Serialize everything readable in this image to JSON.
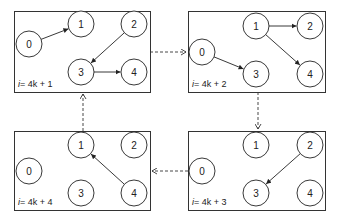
{
  "panels": [
    {
      "id": "p1",
      "caption_var": "i",
      "caption_expr": "= 4k + 1",
      "box": [
        14,
        11,
        136,
        81
      ],
      "nodes": [
        {
          "label": "0",
          "x": 29,
          "y": 44
        },
        {
          "label": "1",
          "x": 81,
          "y": 24
        },
        {
          "label": "2",
          "x": 134,
          "y": 24
        },
        {
          "label": "3",
          "x": 81,
          "y": 72
        },
        {
          "label": "4",
          "x": 134,
          "y": 72
        }
      ],
      "edges": [
        {
          "from": "0",
          "to": "1"
        },
        {
          "from": "2",
          "to": "3"
        },
        {
          "from": "3",
          "to": "4"
        }
      ]
    },
    {
      "id": "p2",
      "caption_var": "i",
      "caption_expr": "= 4k + 2",
      "box": [
        188,
        11,
        137,
        81
      ],
      "nodes": [
        {
          "label": "0",
          "x": 202,
          "y": 52
        },
        {
          "label": "1",
          "x": 256,
          "y": 26
        },
        {
          "label": "2",
          "x": 310,
          "y": 26
        },
        {
          "label": "3",
          "x": 256,
          "y": 74
        },
        {
          "label": "4",
          "x": 310,
          "y": 74
        }
      ],
      "edges": [
        {
          "from": "0",
          "to": "3"
        },
        {
          "from": "1",
          "to": "2"
        },
        {
          "from": "1",
          "to": "4"
        }
      ]
    },
    {
      "id": "p3",
      "caption_var": "i",
      "caption_expr": "= 4k + 3",
      "box": [
        188,
        131,
        137,
        79
      ],
      "nodes": [
        {
          "label": "0",
          "x": 202,
          "y": 171
        },
        {
          "label": "1",
          "x": 256,
          "y": 145
        },
        {
          "label": "2",
          "x": 310,
          "y": 145
        },
        {
          "label": "3",
          "x": 256,
          "y": 193
        },
        {
          "label": "4",
          "x": 310,
          "y": 193
        }
      ],
      "edges": [
        {
          "from": "2",
          "to": "3"
        }
      ]
    },
    {
      "id": "p4",
      "caption_var": "i",
      "caption_expr": "= 4k + 4",
      "box": [
        14,
        131,
        136,
        79
      ],
      "nodes": [
        {
          "label": "0",
          "x": 29,
          "y": 171
        },
        {
          "label": "1",
          "x": 81,
          "y": 145
        },
        {
          "label": "2",
          "x": 134,
          "y": 145
        },
        {
          "label": "3",
          "x": 81,
          "y": 193
        },
        {
          "label": "4",
          "x": 134,
          "y": 193
        }
      ],
      "edges": [
        {
          "from": "4",
          "to": "1"
        }
      ]
    }
  ],
  "flow": [
    {
      "from": "p1",
      "to": "p2",
      "direction": "right"
    },
    {
      "from": "p2",
      "to": "p3",
      "direction": "down"
    },
    {
      "from": "p3",
      "to": "p4",
      "direction": "left"
    },
    {
      "from": "p4",
      "to": "p1",
      "direction": "up"
    }
  ],
  "colors": {
    "stroke": "#222222",
    "background": "#ffffff"
  }
}
